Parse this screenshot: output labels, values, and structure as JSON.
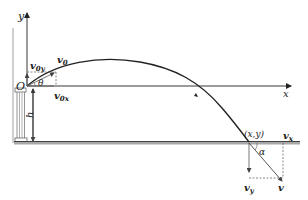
{
  "diagram": {
    "labels": {
      "y_axis": "y",
      "x_axis": "x",
      "origin": "O",
      "height": "h",
      "angle_launch": "θ",
      "angle_landing": "α",
      "landing_point": "(x,y)",
      "v0": "v",
      "v0_sub": "0",
      "v0x": "v",
      "v0x_sub": "0x",
      "v0y": "v",
      "v0y_sub": "0y",
      "v": "v",
      "vx": "v",
      "vx_sub": "x",
      "vy": "v",
      "vy_sub": "y"
    },
    "colors": {
      "line": "#222222",
      "ground": "#9a9a9a",
      "dashed": "#555555",
      "tower": "#888888"
    }
  }
}
